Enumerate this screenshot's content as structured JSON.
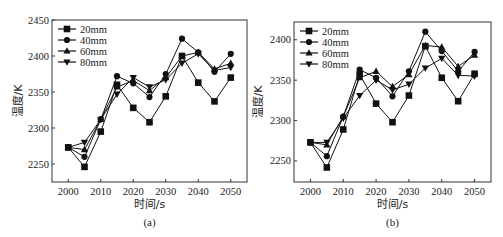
{
  "chart_data": [
    {
      "type": "line",
      "panel_label": "(a)",
      "title": "",
      "xlabel": "时间/s",
      "ylabel": "温度/K",
      "x": [
        2000,
        2005,
        2010,
        2015,
        2020,
        2025,
        2030,
        2035,
        2040,
        2045,
        2050
      ],
      "xticks": [
        2000,
        2010,
        2020,
        2030,
        2040,
        2050
      ],
      "xtick_labels": [
        "2000",
        "2010",
        "2020",
        "2030",
        "2040",
        "2050"
      ],
      "yticks": [
        2250,
        2300,
        2350,
        2400,
        2450
      ],
      "ytick_labels": [
        "2250",
        "2300",
        "2350",
        "2400",
        "2450"
      ],
      "xlim": [
        1995,
        2055
      ],
      "ylim": [
        2225,
        2450
      ],
      "grid": false,
      "legend_position": "top-left",
      "series": [
        {
          "name": "20mm",
          "marker": "square",
          "values": [
            2273,
            2246,
            2295,
            2360,
            2328,
            2308,
            2344,
            2400,
            2363,
            2337,
            2370
          ]
        },
        {
          "name": "40mm",
          "marker": "circle",
          "values": [
            2273,
            2260,
            2312,
            2372,
            2362,
            2343,
            2375,
            2424,
            2405,
            2378,
            2403
          ]
        },
        {
          "name": "60mm",
          "marker": "triangle-up",
          "values": [
            2273,
            2270,
            2312,
            2357,
            2366,
            2352,
            2370,
            2400,
            2405,
            2382,
            2390
          ]
        },
        {
          "name": "80mm",
          "marker": "triangle-down",
          "values": [
            2273,
            2280,
            2312,
            2347,
            2370,
            2357,
            2367,
            2390,
            2403,
            2380,
            2384
          ]
        }
      ]
    },
    {
      "type": "line",
      "panel_label": "(b)",
      "title": "",
      "xlabel": "时间/s",
      "ylabel": "温度/K",
      "x": [
        2000,
        2005,
        2010,
        2015,
        2020,
        2025,
        2030,
        2035,
        2040,
        2045,
        2050
      ],
      "xticks": [
        2000,
        2010,
        2020,
        2030,
        2040,
        2050
      ],
      "xtick_labels": [
        "2000",
        "2010",
        "2020",
        "2030",
        "2040",
        "2050"
      ],
      "yticks": [
        2250,
        2300,
        2350,
        2400
      ],
      "ytick_labels": [
        "2250",
        "2300",
        "2350",
        "2400"
      ],
      "xlim": [
        1995,
        2055
      ],
      "ylim": [
        2224,
        2422
      ],
      "grid": false,
      "legend_position": "top-left",
      "series": [
        {
          "name": "20mm",
          "marker": "square",
          "values": [
            2273,
            2242,
            2289,
            2357,
            2321,
            2298,
            2331,
            2392,
            2353,
            2324,
            2358
          ]
        },
        {
          "name": "40mm",
          "marker": "circle",
          "values": [
            2273,
            2256,
            2305,
            2363,
            2353,
            2330,
            2361,
            2410,
            2386,
            2361,
            2385
          ]
        },
        {
          "name": "60mm",
          "marker": "triangle-up",
          "values": [
            2273,
            2270,
            2305,
            2353,
            2361,
            2342,
            2357,
            2393,
            2391,
            2367,
            2381
          ]
        },
        {
          "name": "80mm",
          "marker": "triangle-down",
          "values": [
            2273,
            2273,
            2303,
            2331,
            2350,
            2338,
            2345,
            2365,
            2377,
            2356,
            2355
          ]
        }
      ]
    }
  ]
}
